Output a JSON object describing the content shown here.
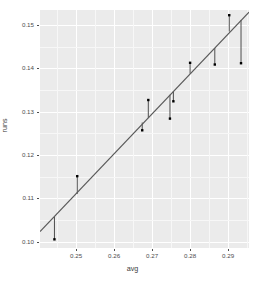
{
  "chart_data": {
    "type": "scatter",
    "title": "",
    "xlabel": "avg",
    "ylabel": "runs",
    "xlim": [
      0.2405,
      0.2955
    ],
    "ylim": [
      0.0985,
      0.1535
    ],
    "xticks": [
      0.25,
      0.26,
      0.27,
      0.28,
      0.29
    ],
    "xtick_labels": [
      "0.25",
      "0.26",
      "0.27",
      "0.28",
      "0.29"
    ],
    "yticks": [
      0.1,
      0.11,
      0.12,
      0.13,
      0.14,
      0.15
    ],
    "ytick_labels": [
      "0.10",
      "0.11",
      "0.12",
      "0.13",
      "0.14",
      "0.15"
    ],
    "grid": true,
    "grid_major_color": "#ffffff",
    "grid_minor_color": "#f7f7f7",
    "panel_background": "#ebebeb",
    "legend": "none",
    "point_color": "#000000",
    "point_size": 2.4,
    "line_color": "#595959",
    "line_width": 1.2,
    "residual_color": "#4d4d4d",
    "residual_width": 1.0,
    "x": [
      0.2443,
      0.2503,
      0.2674,
      0.269,
      0.2747,
      0.2756,
      0.28,
      0.2865,
      0.2903,
      0.2934
    ],
    "y": [
      0.1005,
      0.1151,
      0.1257,
      0.1327,
      0.1284,
      0.1324,
      0.1413,
      0.1409,
      0.1523,
      0.1412
    ],
    "fitted": [
      0.1057,
      0.111,
      0.1275,
      0.1286,
      0.1339,
      0.1347,
      0.1388,
      0.1447,
      0.1485,
      0.1512
    ],
    "fit_line": {
      "type": "linear",
      "x_start": 0.2405,
      "x_end": 0.2955,
      "y_start": 0.1023,
      "y_end": 0.153
    },
    "series": [
      {
        "name": "observed",
        "points": [
          {
            "x": 0.2443,
            "y": 0.1005,
            "fitted": 0.1057
          },
          {
            "x": 0.2503,
            "y": 0.1151,
            "fitted": 0.111
          },
          {
            "x": 0.2674,
            "y": 0.1257,
            "fitted": 0.1275
          },
          {
            "x": 0.269,
            "y": 0.1327,
            "fitted": 0.1286
          },
          {
            "x": 0.2747,
            "y": 0.1284,
            "fitted": 0.1339
          },
          {
            "x": 0.2756,
            "y": 0.1324,
            "fitted": 0.1347
          },
          {
            "x": 0.28,
            "y": 0.1413,
            "fitted": 0.1388
          },
          {
            "x": 0.2865,
            "y": 0.1409,
            "fitted": 0.1447
          },
          {
            "x": 0.2903,
            "y": 0.1523,
            "fitted": 0.1485
          },
          {
            "x": 0.2934,
            "y": 0.1412,
            "fitted": 0.1512
          }
        ]
      }
    ]
  }
}
